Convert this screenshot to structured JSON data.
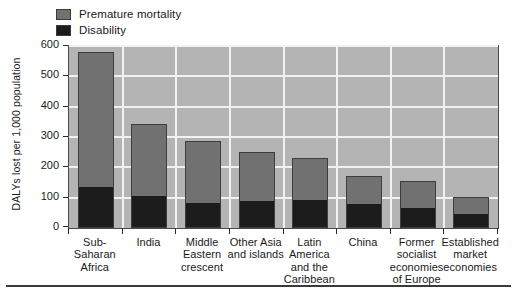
{
  "legend": {
    "items": [
      {
        "label": "Premature mortality",
        "color": "#717171",
        "name": "premature-mortality"
      },
      {
        "label": "Disability",
        "color": "#1c1c1c",
        "name": "disability"
      }
    ]
  },
  "axis": {
    "ylabel": "DALYs lost per 1,000 population",
    "yticks": [
      "0",
      "100",
      "200",
      "300",
      "400",
      "500",
      "600"
    ]
  },
  "chart_data": {
    "type": "bar",
    "title": "",
    "xlabel": "",
    "ylabel": "DALYs lost per 1,000 population",
    "ylim": [
      0,
      600
    ],
    "ytick_values": [
      0,
      100,
      200,
      300,
      400,
      500,
      600
    ],
    "grid": true,
    "stacked": true,
    "legend_position": "top-left",
    "categories": [
      "Sub-Saharan Africa",
      "India",
      "Middle Eastern crescent",
      "Other Asia and islands",
      "Latin America and the Caribbean",
      "China",
      "Former socialist economies of Europe",
      "Established market economies"
    ],
    "category_lines": [
      [
        "Sub-Saharan",
        "Africa"
      ],
      [
        "India"
      ],
      [
        "Middle",
        "Eastern",
        "crescent"
      ],
      [
        "Other Asia",
        "and islands"
      ],
      [
        "Latin",
        "America",
        "and the",
        "Caribbean"
      ],
      [
        "China"
      ],
      [
        "Former",
        "socialist",
        "economies",
        "of Europe"
      ],
      [
        "Established",
        "market",
        "economies"
      ]
    ],
    "series": [
      {
        "name": "Disability",
        "color": "#1c1c1c",
        "values": [
          135,
          107,
          82,
          88,
          92,
          78,
          65,
          47
        ]
      },
      {
        "name": "Premature mortality",
        "color": "#717171",
        "values": [
          445,
          237,
          204,
          162,
          139,
          94,
          90,
          54
        ]
      }
    ],
    "totals": [
      580,
      344,
      286,
      250,
      231,
      172,
      155,
      101
    ]
  }
}
